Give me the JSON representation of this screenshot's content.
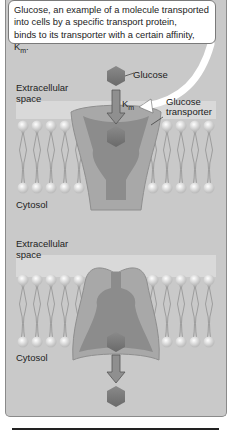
{
  "callout": {
    "line1": "Glucose, an example of a molecule transported",
    "line2": "into cells by a specific transport protein,",
    "line3": "binds to its transporter with a certain affinity, K",
    "line3_sub": "m",
    "line3_end": "."
  },
  "top_panel": {
    "glucose_label": "Glucose",
    "km_label": "K",
    "km_sub": "m",
    "transporter_label_line1": "Glucose",
    "transporter_label_line2": "transporter",
    "extracellular_line1": "Extracellular",
    "extracellular_line2": "space",
    "cytosol": "Cytosol"
  },
  "bottom_panel": {
    "extracellular_line1": "Extracellular",
    "extracellular_line2": "space",
    "cytosol": "Cytosol"
  },
  "colors": {
    "panel_bg": "#c9c9c9",
    "extracellular_band": "#dcdcdc",
    "protein_light": "#a9a9a9",
    "protein_dark": "#8a8a8a",
    "glucose": "#7c7c7c",
    "lipid_head": "#f2f2f2"
  }
}
